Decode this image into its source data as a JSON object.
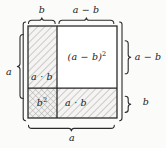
{
  "figure": {
    "background_color": "#fbfbfa",
    "line_color": "#232323",
    "hatch_color": "#9a9a9a",
    "cell_fill": "#f4f3f1",
    "white_fill": "#ffffff"
  },
  "labels": {
    "top_left": "b",
    "top_right": "a − b",
    "left": "a",
    "right_top": "a − b",
    "right_bottom": "b",
    "bottom": "a"
  },
  "cells": {
    "top_left": {
      "text": "a · b",
      "fill": "hatch-diagonal",
      "name": "cell-ab-left"
    },
    "top_right": {
      "text_prefix": "(a − b)",
      "text_exponent": "2",
      "text": "(a − b)²",
      "fill": "white",
      "name": "cell-a-minus-b-squared"
    },
    "bottom_left": {
      "text_prefix": "b",
      "text_exponent": "2",
      "text": "b²",
      "fill": "cross-hatch",
      "name": "cell-b-squared"
    },
    "bottom_right": {
      "text": "a · b",
      "fill": "hatch-diagonal",
      "name": "cell-ab-bottom"
    }
  },
  "geometry": {
    "square_left": 28,
    "square_top": 26,
    "square_right": 117,
    "square_bottom": 118,
    "divider_x": 57,
    "divider_y": 88
  }
}
